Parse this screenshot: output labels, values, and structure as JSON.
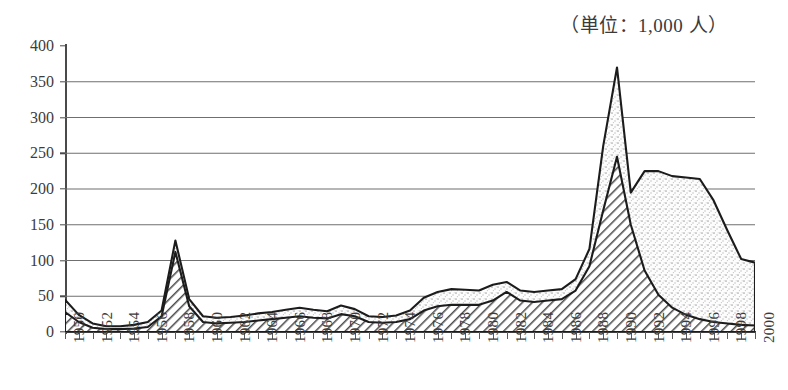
{
  "caption": {
    "unit_note": "（単位：1,000 人）"
  },
  "axes": {
    "y_ticks": [
      0,
      50,
      100,
      150,
      200,
      250,
      300,
      350,
      400
    ],
    "y_min": 0,
    "y_max": 400,
    "x_min": 1950,
    "x_max": 2000,
    "x_tick_labels": [
      "1950",
      "1952",
      "1954",
      "1956",
      "1958",
      "1960",
      "1962",
      "1964",
      "1966",
      "1968",
      "1970",
      "1972",
      "1974",
      "1976",
      "1978",
      "1980",
      "1982",
      "1984",
      "1986",
      "1988",
      "1990",
      "1992",
      "1994",
      "1996",
      "1998",
      "2000"
    ],
    "x_tick_step_years": 2,
    "minor_tick_step_years": 1
  },
  "style": {
    "grid_color": "#6f6f6f",
    "axis_color": "#3d3d3d",
    "outline_color": "#1c1c1c",
    "lower_series_fill": "#9a9a9a",
    "upper_series_fill": "#e8e8e8",
    "text_color": "#3c3c3c"
  },
  "chart_data": {
    "type": "area",
    "title": "",
    "subtitle": "",
    "xlabel": "",
    "ylabel": "",
    "unit": "1,000 人",
    "xlim": [
      1950,
      2000
    ],
    "ylim": [
      0,
      400
    ],
    "grid": true,
    "grid_axis": "y",
    "legend": null,
    "stacked": true,
    "x": [
      1950,
      1951,
      1952,
      1953,
      1954,
      1955,
      1956,
      1957,
      1958,
      1959,
      1960,
      1961,
      1962,
      1963,
      1964,
      1965,
      1966,
      1967,
      1968,
      1969,
      1970,
      1971,
      1972,
      1973,
      1974,
      1975,
      1976,
      1977,
      1978,
      1979,
      1980,
      1981,
      1982,
      1983,
      1984,
      1985,
      1986,
      1987,
      1988,
      1989,
      1990,
      1991,
      1992,
      1993,
      1994,
      1995,
      1996,
      1997,
      1998,
      1999,
      2000
    ],
    "series": [
      {
        "name": "lower-hatched-series",
        "pattern": "diagonal-hatch",
        "values": [
          28,
          14,
          6,
          4,
          4,
          5,
          7,
          22,
          112,
          36,
          14,
          12,
          13,
          14,
          16,
          18,
          20,
          22,
          20,
          19,
          25,
          22,
          14,
          13,
          14,
          18,
          30,
          36,
          38,
          38,
          38,
          44,
          56,
          44,
          42,
          44,
          46,
          58,
          92,
          170,
          245,
          150,
          86,
          52,
          34,
          24,
          18,
          14,
          12,
          10,
          9
        ]
      },
      {
        "name": "upper-stipple-series",
        "pattern": "stipple",
        "values": [
          17,
          10,
          6,
          4,
          4,
          5,
          7,
          8,
          16,
          10,
          8,
          8,
          8,
          9,
          10,
          10,
          11,
          12,
          11,
          10,
          12,
          10,
          8,
          8,
          9,
          12,
          18,
          20,
          22,
          21,
          20,
          22,
          14,
          14,
          14,
          14,
          14,
          16,
          24,
          90,
          125,
          45,
          139,
          173,
          184,
          192,
          196,
          170,
          130,
          92,
          88
        ]
      }
    ],
    "total_values": [
      45,
      24,
      12,
      8,
      8,
      10,
      14,
      30,
      128,
      46,
      22,
      20,
      21,
      23,
      26,
      28,
      31,
      34,
      31,
      29,
      37,
      32,
      22,
      21,
      23,
      30,
      48,
      56,
      60,
      59,
      58,
      66,
      70,
      58,
      56,
      58,
      60,
      74,
      116,
      260,
      370,
      195,
      225,
      225,
      218,
      216,
      214,
      184,
      142,
      102,
      97
    ],
    "annotations": [
      {
        "year": 1958,
        "label": "peak 128"
      },
      {
        "year": 1990,
        "label": "peak 370"
      },
      {
        "year": 1991,
        "label": "dip 195"
      },
      {
        "year": 2000,
        "label": "97"
      }
    ]
  }
}
